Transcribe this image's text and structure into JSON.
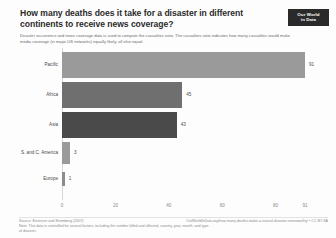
{
  "header": {
    "title": "How many deaths does it take for a disaster in different continents to receive news coverage?",
    "subtitle": "Disaster occurrence and news coverage data is used to compute the casualties ratio. The casualties ratio indicates how many casualties would make media coverage (in major US networks) equally likely, all else equal.",
    "logo_line1": "Our World",
    "logo_line2": "in Data"
  },
  "chart_data": {
    "type": "bar",
    "orientation": "horizontal",
    "title": "How many deaths does it take for a disaster in different continents to receive news coverage?",
    "xlabel": "",
    "ylabel": "",
    "categories": [
      "Pacific",
      "Africa",
      "Asia",
      "S. and C. America",
      "Europe"
    ],
    "values": [
      91,
      45,
      43,
      3,
      1
    ],
    "value_labels": [
      "91",
      "45",
      "43",
      "3",
      "1"
    ],
    "bar_colors": [
      "#9a9a9a",
      "#6f6f6f",
      "#4a4a4a",
      "#9a9a9a",
      "#8c8c8c"
    ],
    "xlim": [
      0,
      91
    ],
    "xticks": [
      0,
      20,
      40,
      60,
      80,
      91
    ],
    "xtick_labels": [
      "0",
      "20",
      "40",
      "60",
      "80",
      "91"
    ],
    "grid": false,
    "legend": "none"
  },
  "footer": {
    "source_line1": "Source: Eisensee and Strömberg (2007)",
    "source_line2": "Note: This data is controlled for several factors, including the number killed and affected, country, year, month, and type of disaster.",
    "attribution_line1": "OurWorldInData.org/how-many-deaths-make-a-natural-disaster-newsworthy/ • CC BY-SA",
    "attribution_line2": ""
  }
}
